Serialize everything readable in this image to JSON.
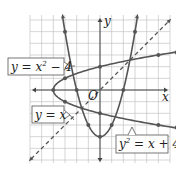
{
  "chart_data": {
    "type": "line",
    "title": "",
    "xlabel": "x",
    "ylabel": "y",
    "origin_label": "O",
    "xlim": [
      -6,
      6
    ],
    "ylim": [
      -6,
      6
    ],
    "grid": true,
    "series": [
      {
        "name": "y = x² − 4",
        "label_main": "y = x",
        "label_sup": "2",
        "label_tail": " − 4",
        "kind": "parabola_up",
        "style": "solid",
        "points": [
          [
            -3,
            5
          ],
          [
            -2,
            0
          ],
          [
            -1,
            -3
          ],
          [
            0,
            -4
          ],
          [
            1,
            -3
          ],
          [
            2,
            0
          ],
          [
            3,
            5
          ]
        ]
      },
      {
        "name": "y² = x + 4",
        "label_main": "y",
        "label_sup": "2",
        "label_tail": " = x + 4",
        "kind": "parabola_sideways",
        "style": "solid",
        "points": [
          [
            -4,
            0
          ],
          [
            -3,
            1
          ],
          [
            -3,
            -1
          ],
          [
            0,
            2
          ],
          [
            0,
            -2
          ],
          [
            5,
            3
          ],
          [
            5,
            -3
          ]
        ]
      },
      {
        "name": "y = x",
        "label_main": "y = x",
        "kind": "line",
        "style": "dashed",
        "points": [
          [
            -6,
            -6
          ],
          [
            6,
            6
          ]
        ]
      }
    ]
  },
  "colors": {
    "curve": "#555555",
    "grid": "#bbbbbb",
    "axis": "#444444",
    "label_border": "#555555"
  }
}
